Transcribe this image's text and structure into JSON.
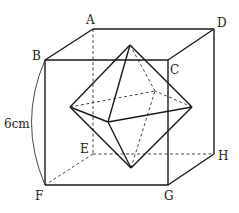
{
  "figure": {
    "cube_labels": {
      "A": "A",
      "B": "B",
      "C": "C",
      "D": "D",
      "E": "E",
      "F": "F",
      "G": "G",
      "H": "H"
    },
    "edge_length_label": "6cm",
    "colors": {
      "line": "#1a1a1a",
      "background": "#ffffff"
    }
  }
}
